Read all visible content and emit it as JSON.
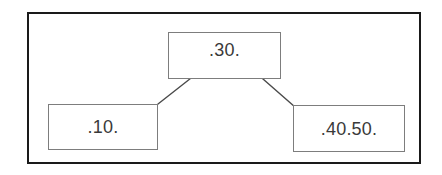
{
  "diagram": {
    "frame": {
      "border_color": "#1a1a1a",
      "background_color": "#ffffff"
    },
    "node_border_color": "#7d7d7d",
    "text_color": "#3a3a3a",
    "line_color": "#4a4a4a",
    "nodes": [
      {
        "id": "top",
        "label": ".30.",
        "role": "parent-node"
      },
      {
        "id": "left",
        "label": ".10.",
        "role": "child-node-left"
      },
      {
        "id": "right",
        "label": ".40.50.",
        "role": "child-node-right"
      }
    ],
    "connectors": [
      {
        "id": "top-to-left",
        "from": "top",
        "to": "left",
        "path": "M 214 60 L 158 104"
      },
      {
        "id": "top-to-right",
        "from": "top",
        "to": "right",
        "path": "M 239 58 L 295 107"
      }
    ]
  }
}
